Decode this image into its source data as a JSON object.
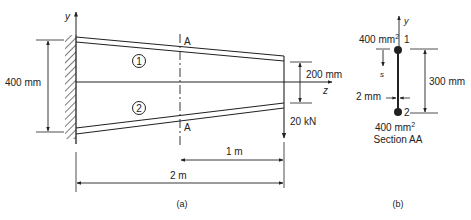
{
  "figure_a": {
    "caption": "(a)",
    "axis_y": "y",
    "axis_z": "z",
    "section_label_top": "A",
    "section_label_bottom": "A",
    "flange_top_number": "1",
    "flange_bottom_number": "2",
    "root_depth": "400 mm",
    "tip_depth": "200 mm",
    "load": "20 kN",
    "dim_section_to_tip": "1 m",
    "dim_span": "2 m"
  },
  "figure_b": {
    "caption": "(b)",
    "axis_y": "y",
    "boom_top_area": "400 mm",
    "boom_top_area_exp": "2",
    "boom_top_number": "1",
    "boom_bottom_area": "400 mm",
    "boom_bottom_area_exp": "2",
    "boom_bottom_number": "2",
    "s_label": "s",
    "web_thickness": "2 mm",
    "depth": "300 mm",
    "title": "Section AA"
  },
  "colors": {
    "line": "#222222",
    "background": "#ffffff"
  }
}
